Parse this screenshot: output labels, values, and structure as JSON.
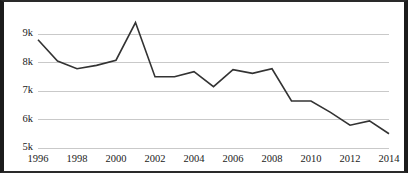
{
  "chart_data": {
    "type": "line",
    "title": "",
    "subtitle": "",
    "xlabel": "",
    "ylabel": "",
    "x": [
      1996,
      1997,
      1998,
      1999,
      2000,
      2001,
      2002,
      2003,
      2004,
      2005,
      2006,
      2007,
      2008,
      2009,
      2010,
      2011,
      2012,
      2013,
      2014
    ],
    "values": [
      8800,
      8050,
      7780,
      7900,
      8080,
      9400,
      7500,
      7500,
      7680,
      7150,
      7750,
      7620,
      7780,
      6650,
      6650,
      6250,
      5800,
      5950,
      5500
    ],
    "series": [
      {
        "name": "series-1",
        "values": [
          8800,
          8050,
          7780,
          7900,
          8080,
          9400,
          7500,
          7500,
          7680,
          7150,
          7750,
          7620,
          7780,
          6650,
          6650,
          6250,
          5800,
          5950,
          5500
        ]
      }
    ],
    "xlim": [
      1996,
      2014
    ],
    "ylim": [
      5000,
      9000
    ],
    "y_ticks": [
      5000,
      6000,
      7000,
      8000,
      9000
    ],
    "y_tick_labels": [
      "5k",
      "6k",
      "7k",
      "8k",
      "9k"
    ],
    "x_ticks": [
      1996,
      1998,
      2000,
      2002,
      2004,
      2006,
      2008,
      2010,
      2012,
      2014
    ],
    "x_tick_labels": [
      "1996",
      "1998",
      "2000",
      "2002",
      "2004",
      "2006",
      "2008",
      "2010",
      "2012",
      "2014"
    ],
    "grid": true,
    "grid_axis": "y",
    "legend": false,
    "legend_position": "none",
    "colors": {
      "line": "#333333",
      "gridline": "#c9c9c9",
      "background": "#ffffff",
      "border": "#1c1c1c",
      "tick_text": "#222222"
    }
  }
}
